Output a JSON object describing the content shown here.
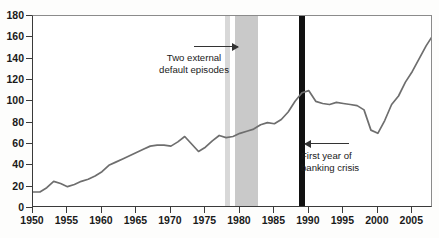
{
  "chart_data": {
    "type": "line",
    "title": "",
    "subtitle": "",
    "xlabel": "",
    "ylabel": "",
    "xlim": [
      1950,
      2008
    ],
    "ylim": [
      0,
      180
    ],
    "ytick_labels": [
      "0",
      "20",
      "40",
      "60",
      "80",
      "100",
      "120",
      "140",
      "160",
      "180"
    ],
    "ytick_values": [
      0,
      20,
      40,
      60,
      80,
      100,
      120,
      140,
      160,
      180
    ],
    "xtick_labels": [
      "1950",
      "1955",
      "1960",
      "1965",
      "1970",
      "1975",
      "1980",
      "1985",
      "1990",
      "1995",
      "2000",
      "2005"
    ],
    "xtick_values": [
      1950,
      1955,
      1960,
      1965,
      1970,
      1975,
      1980,
      1985,
      1990,
      1995,
      2000,
      2005
    ],
    "grid": false,
    "legend": "none",
    "series": [
      {
        "name": "Series",
        "color": "#6e6e6e",
        "x": [
          1950,
          1951,
          1952,
          1953,
          1954,
          1955,
          1956,
          1957,
          1958,
          1959,
          1960,
          1961,
          1962,
          1963,
          1964,
          1965,
          1966,
          1967,
          1968,
          1969,
          1970,
          1971,
          1972,
          1973,
          1974,
          1975,
          1976,
          1977,
          1978,
          1979,
          1980,
          1981,
          1982,
          1983,
          1984,
          1985,
          1986,
          1987,
          1988,
          1989,
          1990,
          1991,
          1992,
          1993,
          1994,
          1995,
          1996,
          1997,
          1998,
          1999,
          2000,
          2001,
          2002,
          2003,
          2004,
          2005,
          2006,
          2007,
          2008
        ],
        "values": [
          15,
          15,
          19,
          25,
          23,
          20,
          22,
          25,
          27,
          30,
          34,
          40,
          43,
          46,
          49,
          52,
          55,
          58,
          59,
          59,
          58,
          62,
          67,
          60,
          53,
          57,
          63,
          68,
          66,
          67,
          70,
          72,
          74,
          78,
          80,
          79,
          83,
          90,
          100,
          108,
          110,
          100,
          98,
          97,
          99,
          98,
          97,
          96,
          92,
          73,
          70,
          82,
          97,
          105,
          118,
          128,
          140,
          152,
          162
        ]
      }
    ],
    "shaded_bands": [
      {
        "name": "external-default-episode-1",
        "from": 1977.8,
        "to": 1978.6,
        "color": "#d8d8d8"
      },
      {
        "name": "external-default-episode-2",
        "from": 1979.3,
        "to": 1982.6,
        "color": "#c9c9c9"
      }
    ],
    "event_lines": [
      {
        "name": "first-year-of-banking-crisis",
        "year": 1989,
        "color": "#111111",
        "width_px": 6
      }
    ],
    "annotations": [
      {
        "name": "two-external-default-episodes",
        "text": "Two external\ndefault episodes",
        "arrow": "right"
      },
      {
        "name": "first-year-of-banking-crisis",
        "text": "First year of\nbanking crisis",
        "arrow": "left"
      }
    ]
  }
}
